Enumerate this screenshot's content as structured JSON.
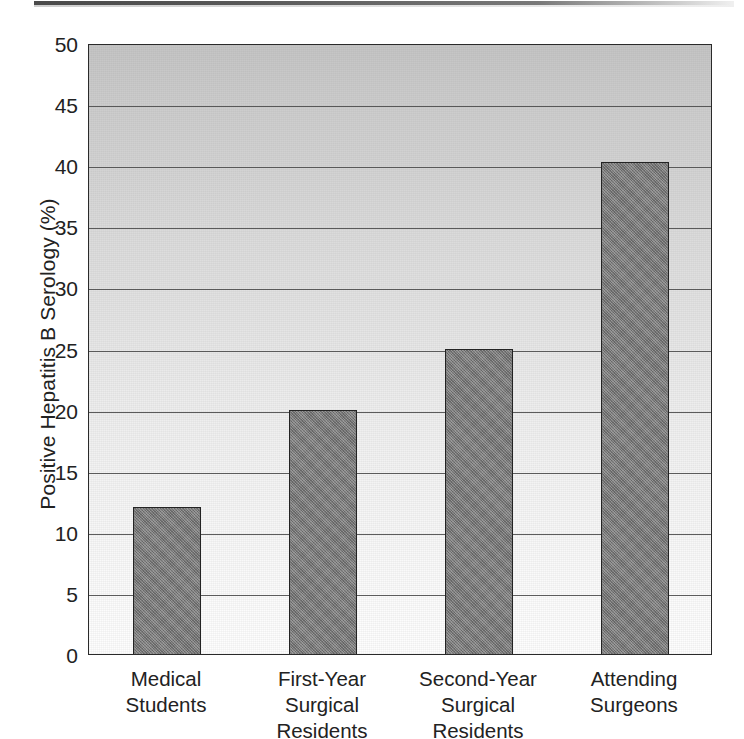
{
  "figure": {
    "scan_artifact": "page-edge-strip"
  },
  "chart_data": {
    "type": "bar",
    "title": "",
    "xlabel": "",
    "ylabel": "Positive Hepatitis B Serology (%)",
    "categories": [
      "Medical\nStudents",
      "First-Year\nSurgical\nResidents",
      "Second-Year\nSurgical\nResidents",
      "Attending\nSurgeons"
    ],
    "values": [
      12,
      20,
      25,
      40.3
    ],
    "ylim": [
      0,
      50
    ],
    "yticks": [
      0,
      5,
      10,
      15,
      20,
      25,
      30,
      35,
      40,
      45,
      50
    ],
    "ytick_labels": [
      "0",
      "5",
      "10",
      "15",
      "20",
      "25",
      "30",
      "35",
      "40",
      "45",
      "50"
    ],
    "grid": true,
    "grid_axis": "y",
    "legend": false,
    "bar_color": "#7d7d7d",
    "bar_edge_color": "#232323",
    "plot_background": "vertical-gradient-gray-to-white",
    "axis_color": "#2a2a2a"
  }
}
